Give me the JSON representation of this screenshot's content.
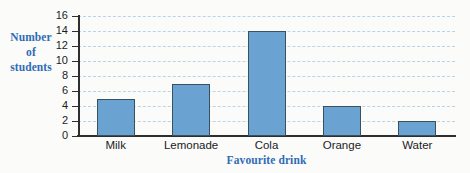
{
  "chart_data": {
    "type": "bar",
    "title": "",
    "categories": [
      "Milk",
      "Lemonade",
      "Cola",
      "Orange",
      "Water"
    ],
    "values": [
      5,
      7,
      14,
      4,
      2
    ],
    "xlabel": "Favourite drink",
    "ylabel": "Number of students",
    "ylabel_lines": [
      "Number",
      "of",
      "students"
    ],
    "ylim": [
      0,
      16
    ],
    "ytick_labels": [
      "0",
      "2",
      "4",
      "6",
      "8",
      "10",
      "12",
      "14",
      "16"
    ],
    "ytick_values": [
      0,
      2,
      4,
      6,
      8,
      10,
      12,
      14,
      16
    ],
    "grid": true,
    "grid_axis": "y",
    "legend": null,
    "colors": {
      "bar_fill": "#6aa3d2",
      "bar_edge": "#39505f",
      "gridline": "#b9d4ea",
      "axis": "#2e2e2e",
      "axis_title": "#2f6cb5",
      "tick_label": "#1c1c1c",
      "background": "#fbfbfa"
    }
  }
}
